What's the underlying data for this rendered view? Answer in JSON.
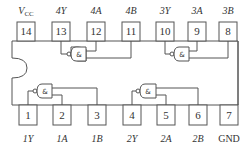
{
  "chip": {
    "type": "quad 2-input gate IC pinout",
    "gate_symbol": "&"
  },
  "top_pins": [
    {
      "number": "14",
      "label": "V",
      "sub": "CC"
    },
    {
      "number": "13",
      "label": "4Y"
    },
    {
      "number": "12",
      "label": "4A"
    },
    {
      "number": "11",
      "label": "4B"
    },
    {
      "number": "10",
      "label": "3Y"
    },
    {
      "number": "9",
      "label": "3A"
    },
    {
      "number": "8",
      "label": "3B"
    }
  ],
  "bottom_pins": [
    {
      "number": "1",
      "label": "1Y"
    },
    {
      "number": "2",
      "label": "1A"
    },
    {
      "number": "3",
      "label": "1B"
    },
    {
      "number": "4",
      "label": "2Y"
    },
    {
      "number": "5",
      "label": "2A"
    },
    {
      "number": "6",
      "label": "2B"
    },
    {
      "number": "7",
      "label": "GND"
    }
  ],
  "colors": {
    "stroke": "#555555",
    "text": "#333333",
    "background": "#ffffff"
  }
}
